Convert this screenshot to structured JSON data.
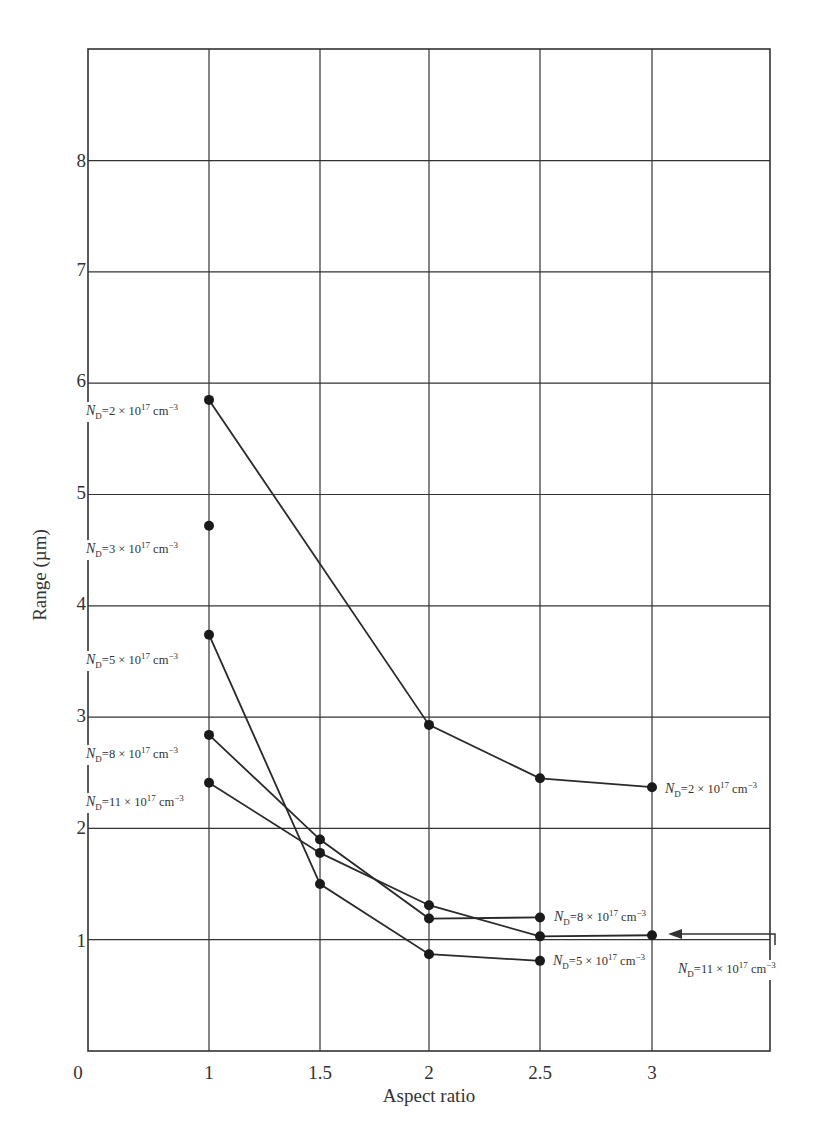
{
  "chart_data": {
    "type": "line",
    "title": "",
    "xlabel": "Aspect ratio",
    "ylabel": "Range (µm)",
    "xlim": [
      0,
      3.5
    ],
    "ylim": [
      0,
      9
    ],
    "grid": true,
    "x_ticks": [
      "0",
      "1",
      "1.5",
      "2",
      "2.5",
      "3"
    ],
    "y_ticks": [
      "8",
      "7",
      "6",
      "5",
      "4",
      "3",
      "2",
      "1"
    ],
    "series": [
      {
        "name": "N_D = 2 × 10^17 cm^-3",
        "x": [
          1,
          2,
          2.5,
          3
        ],
        "values": [
          5.85,
          2.93,
          2.45,
          2.37
        ]
      },
      {
        "name": "N_D = 3 × 10^17 cm^-3",
        "x": [
          1
        ],
        "values": [
          4.72
        ]
      },
      {
        "name": "N_D = 5 × 10^17 cm^-3",
        "x": [
          1,
          1.5,
          2,
          2.5
        ],
        "values": [
          3.74,
          1.5,
          0.87,
          0.81
        ]
      },
      {
        "name": "N_D = 8 × 10^17 cm^-3",
        "x": [
          1,
          1.5,
          2,
          2.5
        ],
        "values": [
          2.84,
          1.9,
          1.19,
          1.2
        ]
      },
      {
        "name": "N_D = 11 × 10^17 cm^-3",
        "x": [
          1,
          1.5,
          2,
          2.5,
          3
        ],
        "values": [
          2.41,
          1.78,
          1.31,
          1.03,
          1.04
        ]
      }
    ],
    "annotations": [
      {
        "text": "N_D = 2 × 10^17 cm^-3",
        "at": "x=1 left"
      },
      {
        "text": "N_D = 3 × 10^17 cm^-3",
        "at": "x=1 left"
      },
      {
        "text": "N_D = 5 × 10^17 cm^-3",
        "at": "x=1 left"
      },
      {
        "text": "N_D = 8 × 10^17 cm^-3",
        "at": "x=1 left"
      },
      {
        "text": "N_D = 11 × 10^17 cm^-3",
        "at": "x=1 left"
      },
      {
        "text": "N_D = 2 × 10^17 cm^-3",
        "at": "x=3 right"
      },
      {
        "text": "N_D = 8 × 10^17 cm^-3",
        "at": "x=2.5 right"
      },
      {
        "text": "N_D = 5 × 10^17 cm^-3",
        "at": "x=2.5 right"
      },
      {
        "text": "N_D = 11 × 10^17 cm^-3",
        "at": "x=3 right, with arrow"
      }
    ]
  },
  "labels": {
    "xlabel": "Aspect ratio",
    "ylabel": "Range (µm)",
    "x_ticks": [
      "0",
      "1",
      "1.5",
      "2",
      "2.5",
      "3"
    ],
    "y_ticks": [
      "8",
      "7",
      "6",
      "5",
      "4",
      "3",
      "2",
      "1"
    ],
    "nd_prefix": "N",
    "nd_sub": "D",
    "eq": "=",
    "times_ten": "× 10",
    "exp17": "17",
    "unit": "cm",
    "exp_unit": "−3",
    "coeffs": {
      "a": "2",
      "b": "3",
      "c": "5",
      "d": "8",
      "e": "11"
    }
  }
}
